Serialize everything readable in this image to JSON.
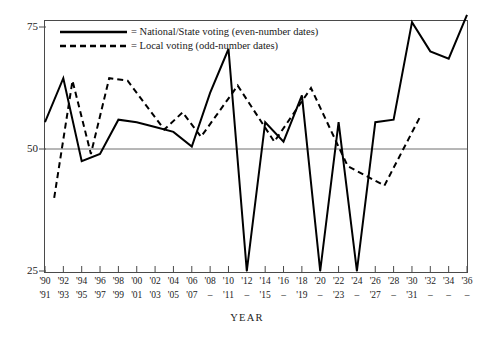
{
  "chart_data": {
    "type": "line",
    "title": "",
    "xlabel": "YEAR",
    "ylabel": "",
    "ylim": [
      25,
      78
    ],
    "yticks": [
      25,
      50,
      75
    ],
    "xlim": [
      1990,
      1936
    ],
    "grid": false,
    "gridline_at": 50,
    "legend_position": "top-left-inside",
    "x_axis_rows": {
      "even_row": [
        "'90",
        "'92",
        "'94",
        "'96",
        "'98",
        "'00",
        "'02",
        "'04",
        "'06",
        "'08",
        "'10",
        "'12",
        "'14",
        "'16",
        "'18",
        "'20",
        "'22",
        "'24",
        "'26",
        "'28",
        "'30",
        "'32",
        "'34",
        "'36"
      ],
      "odd_row": [
        "'91",
        "'93",
        "'95",
        "'97",
        "'99",
        "'01",
        "'03",
        "'05",
        "'07",
        "–",
        "'11",
        "–",
        "'15",
        "–",
        "'19",
        "–",
        "'23",
        "–",
        "'27",
        "–",
        "'31",
        "–",
        "–",
        "–"
      ]
    },
    "series": [
      {
        "name": "National/State voting (even-number dates)",
        "style": "solid",
        "color": "#000000",
        "x": [
          1990,
          1992,
          1994,
          1996,
          1998,
          2000,
          2002,
          2004,
          2006,
          2008,
          2010,
          2012,
          2014,
          2016,
          2018,
          2020,
          2022,
          2024,
          2026,
          2028,
          2030,
          2032,
          2034,
          2036
        ],
        "values": [
          55.5,
          64.5,
          47.5,
          49.0,
          56.0,
          55.5,
          54.5,
          53.5,
          50.5,
          61.5,
          70.5,
          25.0,
          55.5,
          51.5,
          61.0,
          25.0,
          55.5,
          25.0,
          55.5,
          56.0,
          76.0,
          70.0,
          68.5,
          77.5
        ]
      },
      {
        "name": "Local voting (odd-number dates)",
        "style": "dashed",
        "color": "#000000",
        "x": [
          1991,
          1993,
          1995,
          1997,
          1999,
          2001,
          2003,
          2005,
          2007,
          2011,
          2015,
          2019,
          2023,
          2027,
          2031
        ],
        "values": [
          40.0,
          64.0,
          49.0,
          64.5,
          64.0,
          59.0,
          54.0,
          57.5,
          52.5,
          63.0,
          51.5,
          62.5,
          46.5,
          42.5,
          57.0
        ]
      }
    ]
  },
  "legend": {
    "entries": [
      {
        "marker": "solid-line",
        "label": "= National/State voting (even-number dates)"
      },
      {
        "marker": "dashed-line",
        "label": "= Local voting (odd-number dates)"
      }
    ]
  }
}
